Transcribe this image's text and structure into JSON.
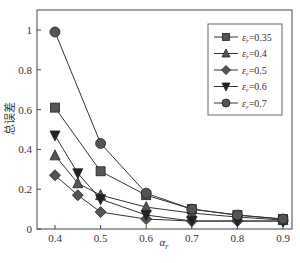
{
  "chart_data": {
    "type": "line",
    "title": "",
    "xlabel": "α_r",
    "ylabel": "总误差",
    "xlim": [
      0.36,
      0.92
    ],
    "ylim": [
      0,
      1.1
    ],
    "xticks": [
      0.4,
      0.5,
      0.6,
      0.7,
      0.8,
      0.9
    ],
    "yticks": [
      0,
      0.2,
      0.4,
      0.6,
      0.8,
      1
    ],
    "xtick_labels": [
      "0.4",
      "0.5",
      "0.6",
      "0.7",
      "0.8",
      "0.9"
    ],
    "ytick_labels": [
      "0",
      "0.2",
      "0.4",
      "0.6",
      "0.8",
      "1"
    ],
    "grid": false,
    "legend_position": "upper right",
    "series": [
      {
        "name": "εr=0.35",
        "legend_prefix": "ε",
        "legend_sub": "r",
        "legend_suffix": "=0.35",
        "marker": "square",
        "x": [
          0.4,
          0.5,
          0.6,
          0.7,
          0.8,
          0.9
        ],
        "values": [
          0.61,
          0.29,
          0.17,
          0.1,
          0.07,
          0.05
        ]
      },
      {
        "name": "εr=0.4",
        "legend_prefix": "ε",
        "legend_sub": "r",
        "legend_suffix": "=0.4",
        "marker": "triangle-up",
        "x": [
          0.4,
          0.45,
          0.5,
          0.6,
          0.7,
          0.8,
          0.9
        ],
        "values": [
          0.37,
          0.23,
          0.17,
          0.11,
          0.08,
          0.06,
          0.045
        ]
      },
      {
        "name": "εr=0.5",
        "legend_prefix": "ε",
        "legend_sub": "r",
        "legend_suffix": "=0.5",
        "marker": "diamond",
        "x": [
          0.4,
          0.45,
          0.5,
          0.6,
          0.7,
          0.8,
          0.9
        ],
        "values": [
          0.27,
          0.17,
          0.085,
          0.05,
          0.04,
          0.04,
          0.04
        ]
      },
      {
        "name": "εr=0.6",
        "legend_prefix": "ε",
        "legend_sub": "r",
        "legend_suffix": "=0.6",
        "marker": "triangle-down",
        "x": [
          0.4,
          0.45,
          0.5,
          0.6,
          0.7,
          0.8,
          0.9
        ],
        "values": [
          0.47,
          0.28,
          0.15,
          0.07,
          0.04,
          0.04,
          0.04
        ]
      },
      {
        "name": "εr=0.7",
        "legend_prefix": "ε",
        "legend_sub": "r",
        "legend_suffix": "=0.7",
        "marker": "circle",
        "x": [
          0.4,
          0.5,
          0.6,
          0.7,
          0.8,
          0.9
        ],
        "values": [
          0.99,
          0.43,
          0.18,
          0.1,
          0.07,
          0.05
        ]
      }
    ],
    "colors": {
      "line": "#333333",
      "marker_fill": "#555555",
      "axis": "#444444"
    }
  }
}
